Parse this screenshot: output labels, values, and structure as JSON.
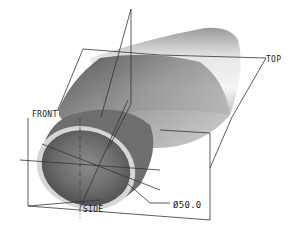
{
  "view": {
    "type": "3d-model-viewport",
    "background": "#ffffff"
  },
  "datum_planes": [
    {
      "name": "TOP",
      "label": "TOP"
    },
    {
      "name": "FRONT",
      "label": "FRONT"
    },
    {
      "name": "SIDE",
      "label": "SIDE"
    }
  ],
  "dimensions": [
    {
      "type": "diameter",
      "symbol": "Ø",
      "value": "50.0",
      "label": "Ø50.0"
    }
  ],
  "colors": {
    "datum_line": "#333333",
    "pipe_dark": "#4a4a4a",
    "pipe_light": "#f2f2f2",
    "rim": "#d8d8d8"
  }
}
